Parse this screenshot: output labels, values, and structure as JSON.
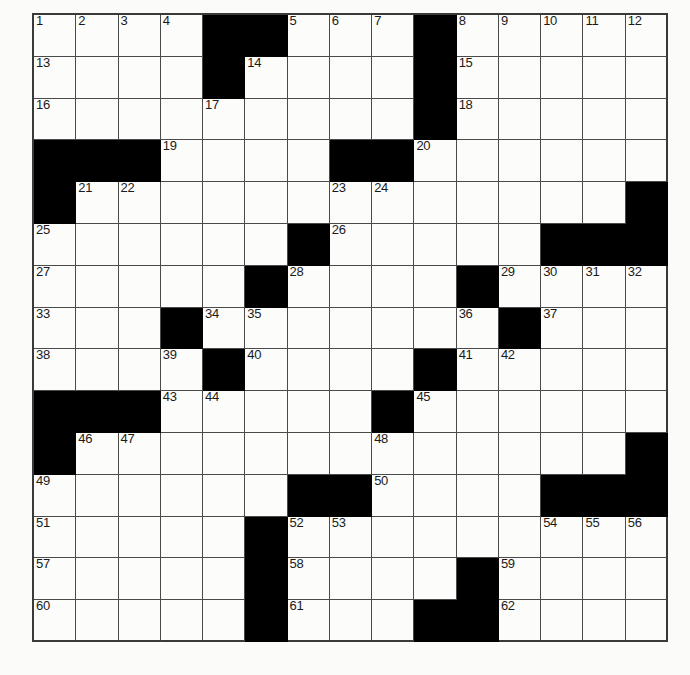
{
  "puzzle": {
    "type": "crossword-grid",
    "rows": 15,
    "columns": 15,
    "total_cells": 225,
    "max_clue_number": 62,
    "colors": {
      "block": "#000000",
      "cell": "#fcfcfa",
      "grid_line": "#4a4a4a",
      "frame": "#3a3a3a",
      "number_text": "#1a1a1a",
      "page_background": "#fbfbfa"
    },
    "legend": {
      "white": "open letter square",
      "black": "blocked square"
    },
    "numbers_in_reading_order": [
      1,
      2,
      3,
      4,
      5,
      6,
      7,
      8,
      9,
      10,
      11,
      12,
      13,
      14,
      15,
      16,
      17,
      18,
      19,
      20,
      21,
      22,
      23,
      24,
      25,
      26,
      27,
      28,
      29,
      30,
      31,
      32,
      33,
      34,
      35,
      36,
      37,
      38,
      39,
      40,
      41,
      42,
      43,
      44,
      45,
      46,
      47,
      48,
      49,
      50,
      51,
      52,
      53,
      54,
      55,
      56,
      57,
      58,
      59,
      60,
      61,
      62
    ],
    "grid": [
      [
        {
          "black": false,
          "number": "1"
        },
        {
          "black": false,
          "number": "2"
        },
        {
          "black": false,
          "number": "3"
        },
        {
          "black": false,
          "number": "4"
        },
        {
          "black": true,
          "number": ""
        },
        {
          "black": true,
          "number": ""
        },
        {
          "black": false,
          "number": "5"
        },
        {
          "black": false,
          "number": "6"
        },
        {
          "black": false,
          "number": "7"
        },
        {
          "black": true,
          "number": ""
        },
        {
          "black": false,
          "number": "8"
        },
        {
          "black": false,
          "number": "9"
        },
        {
          "black": false,
          "number": "10"
        },
        {
          "black": false,
          "number": "11"
        },
        {
          "black": false,
          "number": "12"
        }
      ],
      [
        {
          "black": false,
          "number": "13"
        },
        {
          "black": false,
          "number": ""
        },
        {
          "black": false,
          "number": ""
        },
        {
          "black": false,
          "number": ""
        },
        {
          "black": true,
          "number": ""
        },
        {
          "black": false,
          "number": "14"
        },
        {
          "black": false,
          "number": ""
        },
        {
          "black": false,
          "number": ""
        },
        {
          "black": false,
          "number": ""
        },
        {
          "black": true,
          "number": ""
        },
        {
          "black": false,
          "number": "15"
        },
        {
          "black": false,
          "number": ""
        },
        {
          "black": false,
          "number": ""
        },
        {
          "black": false,
          "number": ""
        },
        {
          "black": false,
          "number": ""
        }
      ],
      [
        {
          "black": false,
          "number": "16"
        },
        {
          "black": false,
          "number": ""
        },
        {
          "black": false,
          "number": ""
        },
        {
          "black": false,
          "number": ""
        },
        {
          "black": false,
          "number": "17"
        },
        {
          "black": false,
          "number": ""
        },
        {
          "black": false,
          "number": ""
        },
        {
          "black": false,
          "number": ""
        },
        {
          "black": false,
          "number": ""
        },
        {
          "black": true,
          "number": ""
        },
        {
          "black": false,
          "number": "18"
        },
        {
          "black": false,
          "number": ""
        },
        {
          "black": false,
          "number": ""
        },
        {
          "black": false,
          "number": ""
        },
        {
          "black": false,
          "number": ""
        }
      ],
      [
        {
          "black": true,
          "number": ""
        },
        {
          "black": true,
          "number": ""
        },
        {
          "black": true,
          "number": ""
        },
        {
          "black": false,
          "number": "19"
        },
        {
          "black": false,
          "number": ""
        },
        {
          "black": false,
          "number": ""
        },
        {
          "black": false,
          "number": ""
        },
        {
          "black": true,
          "number": ""
        },
        {
          "black": true,
          "number": ""
        },
        {
          "black": false,
          "number": "20"
        },
        {
          "black": false,
          "number": ""
        },
        {
          "black": false,
          "number": ""
        },
        {
          "black": false,
          "number": ""
        },
        {
          "black": false,
          "number": ""
        },
        {
          "black": false,
          "number": ""
        }
      ],
      [
        {
          "black": true,
          "number": ""
        },
        {
          "black": false,
          "number": "21"
        },
        {
          "black": false,
          "number": "22"
        },
        {
          "black": false,
          "number": ""
        },
        {
          "black": false,
          "number": ""
        },
        {
          "black": false,
          "number": ""
        },
        {
          "black": false,
          "number": ""
        },
        {
          "black": false,
          "number": "23"
        },
        {
          "black": false,
          "number": "24"
        },
        {
          "black": false,
          "number": ""
        },
        {
          "black": false,
          "number": ""
        },
        {
          "black": false,
          "number": ""
        },
        {
          "black": false,
          "number": ""
        },
        {
          "black": false,
          "number": ""
        },
        {
          "black": true,
          "number": ""
        }
      ],
      [
        {
          "black": false,
          "number": "25"
        },
        {
          "black": false,
          "number": ""
        },
        {
          "black": false,
          "number": ""
        },
        {
          "black": false,
          "number": ""
        },
        {
          "black": false,
          "number": ""
        },
        {
          "black": false,
          "number": ""
        },
        {
          "black": true,
          "number": ""
        },
        {
          "black": false,
          "number": "26"
        },
        {
          "black": false,
          "number": ""
        },
        {
          "black": false,
          "number": ""
        },
        {
          "black": false,
          "number": ""
        },
        {
          "black": false,
          "number": ""
        },
        {
          "black": true,
          "number": ""
        },
        {
          "black": true,
          "number": ""
        },
        {
          "black": true,
          "number": ""
        }
      ],
      [
        {
          "black": false,
          "number": "27"
        },
        {
          "black": false,
          "number": ""
        },
        {
          "black": false,
          "number": ""
        },
        {
          "black": false,
          "number": ""
        },
        {
          "black": false,
          "number": ""
        },
        {
          "black": true,
          "number": ""
        },
        {
          "black": false,
          "number": "28"
        },
        {
          "black": false,
          "number": ""
        },
        {
          "black": false,
          "number": ""
        },
        {
          "black": false,
          "number": ""
        },
        {
          "black": true,
          "number": ""
        },
        {
          "black": false,
          "number": "29"
        },
        {
          "black": false,
          "number": "30"
        },
        {
          "black": false,
          "number": "31"
        },
        {
          "black": false,
          "number": "32"
        }
      ],
      [
        {
          "black": false,
          "number": "33"
        },
        {
          "black": false,
          "number": ""
        },
        {
          "black": false,
          "number": ""
        },
        {
          "black": true,
          "number": ""
        },
        {
          "black": false,
          "number": "34"
        },
        {
          "black": false,
          "number": "35"
        },
        {
          "black": false,
          "number": ""
        },
        {
          "black": false,
          "number": ""
        },
        {
          "black": false,
          "number": ""
        },
        {
          "black": false,
          "number": ""
        },
        {
          "black": false,
          "number": "36"
        },
        {
          "black": true,
          "number": ""
        },
        {
          "black": false,
          "number": "37"
        },
        {
          "black": false,
          "number": ""
        },
        {
          "black": false,
          "number": ""
        }
      ],
      [
        {
          "black": false,
          "number": "38"
        },
        {
          "black": false,
          "number": ""
        },
        {
          "black": false,
          "number": ""
        },
        {
          "black": false,
          "number": "39"
        },
        {
          "black": true,
          "number": ""
        },
        {
          "black": false,
          "number": "40"
        },
        {
          "black": false,
          "number": ""
        },
        {
          "black": false,
          "number": ""
        },
        {
          "black": false,
          "number": ""
        },
        {
          "black": true,
          "number": ""
        },
        {
          "black": false,
          "number": "41"
        },
        {
          "black": false,
          "number": "42"
        },
        {
          "black": false,
          "number": ""
        },
        {
          "black": false,
          "number": ""
        },
        {
          "black": false,
          "number": ""
        }
      ],
      [
        {
          "black": true,
          "number": ""
        },
        {
          "black": true,
          "number": ""
        },
        {
          "black": true,
          "number": ""
        },
        {
          "black": false,
          "number": "43"
        },
        {
          "black": false,
          "number": "44"
        },
        {
          "black": false,
          "number": ""
        },
        {
          "black": false,
          "number": ""
        },
        {
          "black": false,
          "number": ""
        },
        {
          "black": true,
          "number": ""
        },
        {
          "black": false,
          "number": "45"
        },
        {
          "black": false,
          "number": ""
        },
        {
          "black": false,
          "number": ""
        },
        {
          "black": false,
          "number": ""
        },
        {
          "black": false,
          "number": ""
        },
        {
          "black": false,
          "number": ""
        }
      ],
      [
        {
          "black": true,
          "number": ""
        },
        {
          "black": false,
          "number": "46"
        },
        {
          "black": false,
          "number": "47"
        },
        {
          "black": false,
          "number": ""
        },
        {
          "black": false,
          "number": ""
        },
        {
          "black": false,
          "number": ""
        },
        {
          "black": false,
          "number": ""
        },
        {
          "black": false,
          "number": ""
        },
        {
          "black": false,
          "number": "48"
        },
        {
          "black": false,
          "number": ""
        },
        {
          "black": false,
          "number": ""
        },
        {
          "black": false,
          "number": ""
        },
        {
          "black": false,
          "number": ""
        },
        {
          "black": false,
          "number": ""
        },
        {
          "black": true,
          "number": ""
        }
      ],
      [
        {
          "black": false,
          "number": "49"
        },
        {
          "black": false,
          "number": ""
        },
        {
          "black": false,
          "number": ""
        },
        {
          "black": false,
          "number": ""
        },
        {
          "black": false,
          "number": ""
        },
        {
          "black": false,
          "number": ""
        },
        {
          "black": true,
          "number": ""
        },
        {
          "black": true,
          "number": ""
        },
        {
          "black": false,
          "number": "50"
        },
        {
          "black": false,
          "number": ""
        },
        {
          "black": false,
          "number": ""
        },
        {
          "black": false,
          "number": ""
        },
        {
          "black": true,
          "number": ""
        },
        {
          "black": true,
          "number": ""
        },
        {
          "black": true,
          "number": ""
        }
      ],
      [
        {
          "black": false,
          "number": "51"
        },
        {
          "black": false,
          "number": ""
        },
        {
          "black": false,
          "number": ""
        },
        {
          "black": false,
          "number": ""
        },
        {
          "black": false,
          "number": ""
        },
        {
          "black": true,
          "number": ""
        },
        {
          "black": false,
          "number": "52"
        },
        {
          "black": false,
          "number": "53"
        },
        {
          "black": false,
          "number": ""
        },
        {
          "black": false,
          "number": ""
        },
        {
          "black": false,
          "number": ""
        },
        {
          "black": false,
          "number": ""
        },
        {
          "black": false,
          "number": "54"
        },
        {
          "black": false,
          "number": "55"
        },
        {
          "black": false,
          "number": "56"
        }
      ],
      [
        {
          "black": false,
          "number": "57"
        },
        {
          "black": false,
          "number": ""
        },
        {
          "black": false,
          "number": ""
        },
        {
          "black": false,
          "number": ""
        },
        {
          "black": false,
          "number": ""
        },
        {
          "black": true,
          "number": ""
        },
        {
          "black": false,
          "number": "58"
        },
        {
          "black": false,
          "number": ""
        },
        {
          "black": false,
          "number": ""
        },
        {
          "black": false,
          "number": ""
        },
        {
          "black": true,
          "number": ""
        },
        {
          "black": false,
          "number": "59"
        },
        {
          "black": false,
          "number": ""
        },
        {
          "black": false,
          "number": ""
        },
        {
          "black": false,
          "number": ""
        }
      ],
      [
        {
          "black": false,
          "number": "60"
        },
        {
          "black": false,
          "number": ""
        },
        {
          "black": false,
          "number": ""
        },
        {
          "black": false,
          "number": ""
        },
        {
          "black": false,
          "number": ""
        },
        {
          "black": true,
          "number": ""
        },
        {
          "black": false,
          "number": "61"
        },
        {
          "black": false,
          "number": ""
        },
        {
          "black": false,
          "number": ""
        },
        {
          "black": true,
          "number": ""
        },
        {
          "black": true,
          "number": ""
        },
        {
          "black": false,
          "number": "62"
        },
        {
          "black": false,
          "number": ""
        },
        {
          "black": false,
          "number": ""
        },
        {
          "black": false,
          "number": ""
        }
      ]
    ]
  }
}
